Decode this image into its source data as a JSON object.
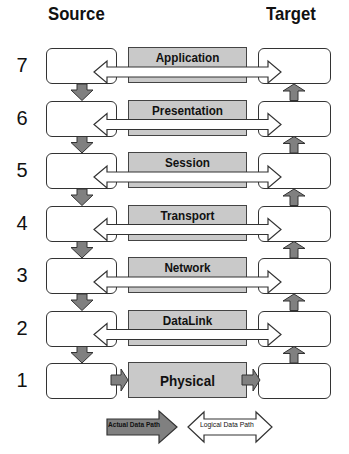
{
  "headers": {
    "source": "Source",
    "target": "Target"
  },
  "layers": [
    {
      "number": "7",
      "name": "Application"
    },
    {
      "number": "6",
      "name": "Presentation"
    },
    {
      "number": "5",
      "name": "Session"
    },
    {
      "number": "4",
      "name": "Transport"
    },
    {
      "number": "3",
      "name": "Network"
    },
    {
      "number": "2",
      "name": "DataLink"
    },
    {
      "number": "1",
      "name": "Physical"
    }
  ],
  "legend": {
    "actual": "Actual Data Path",
    "logical": "Logical Data Path"
  },
  "colors": {
    "layer_fill": "#c9c9c9",
    "actual_arrow": "#808080",
    "logical_arrow": "#ffffff",
    "stroke": "#333333"
  }
}
